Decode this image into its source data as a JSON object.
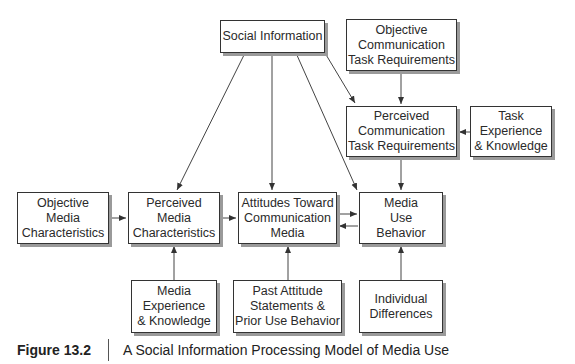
{
  "diagram": {
    "nodes": {
      "social_information": {
        "label": "Social Information"
      },
      "objective_comm_task": {
        "label": "Objective\nCommunication\nTask Requirements"
      },
      "perceived_comm_task": {
        "label": "Perceived\nCommunication\nTask Requirements"
      },
      "task_experience": {
        "label": "Task\nExperience\n& Knowledge"
      },
      "objective_media": {
        "label": "Objective\nMedia\nCharacteristics"
      },
      "perceived_media": {
        "label": "Perceived\nMedia\nCharacteristics"
      },
      "attitudes": {
        "label": "Attitudes Toward\nCommunication\nMedia"
      },
      "media_use": {
        "label": "Media\nUse\nBehavior"
      },
      "media_experience": {
        "label": "Media\nExperience\n& Knowledge"
      },
      "past_attitude": {
        "label": "Past Attitude\nStatements &\nPrior Use Behavior"
      },
      "individual_differences": {
        "label": "Individual\nDifferences"
      }
    },
    "edges": [
      {
        "from": "social_information",
        "to": "perceived_media"
      },
      {
        "from": "social_information",
        "to": "attitudes"
      },
      {
        "from": "social_information",
        "to": "media_use"
      },
      {
        "from": "social_information",
        "to": "perceived_comm_task"
      },
      {
        "from": "objective_comm_task",
        "to": "perceived_comm_task"
      },
      {
        "from": "task_experience",
        "to": "perceived_comm_task"
      },
      {
        "from": "perceived_comm_task",
        "to": "media_use"
      },
      {
        "from": "objective_media",
        "to": "perceived_media"
      },
      {
        "from": "perceived_media",
        "to": "attitudes"
      },
      {
        "from": "attitudes",
        "to": "media_use"
      },
      {
        "from": "media_use",
        "to": "attitudes"
      },
      {
        "from": "media_experience",
        "to": "perceived_media"
      },
      {
        "from": "past_attitude",
        "to": "attitudes"
      },
      {
        "from": "individual_differences",
        "to": "media_use"
      }
    ]
  },
  "caption": {
    "figure_number": "Figure 13.2",
    "title": "A Social Information Processing Model of Media Use"
  }
}
